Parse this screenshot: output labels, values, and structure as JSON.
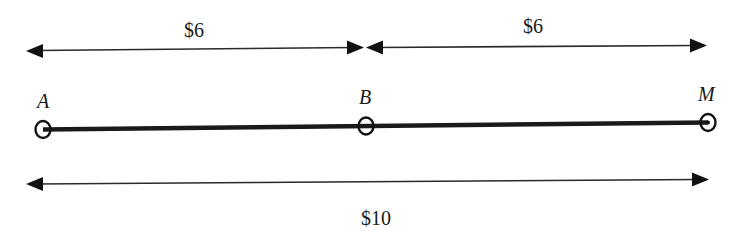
{
  "diagram": {
    "type": "segment-distance-diagram",
    "points": [
      {
        "id": "A",
        "label": "A",
        "x": 43,
        "y": 129
      },
      {
        "id": "B",
        "label": "B",
        "x": 366,
        "y": 126
      },
      {
        "id": "M",
        "label": "M",
        "x": 708,
        "y": 123
      }
    ],
    "segments": [
      {
        "from": "A",
        "to": "B",
        "label": "$6",
        "position": "above"
      },
      {
        "from": "B",
        "to": "M",
        "label": "$6",
        "position": "above"
      },
      {
        "from": "A",
        "to": "M",
        "label": "$10",
        "position": "below"
      }
    ],
    "labels": {
      "top_left_distance": "$6",
      "top_right_distance": "$6",
      "bottom_total_distance": "$10",
      "point_a": "A",
      "point_b": "B",
      "point_m": "M"
    },
    "colors": {
      "stroke": "#1a1a1a",
      "background": "#ffffff"
    }
  }
}
